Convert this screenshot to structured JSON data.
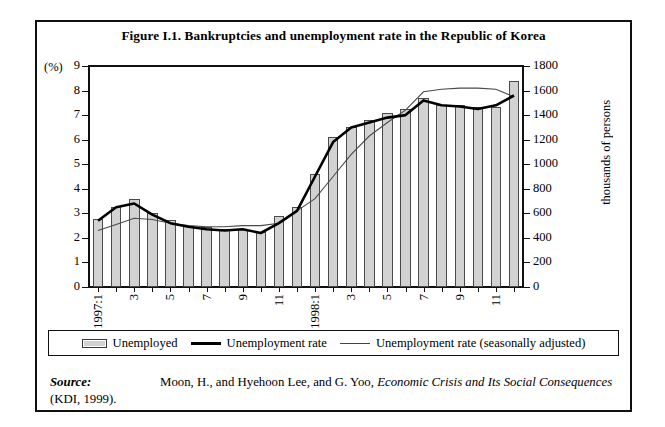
{
  "figure": {
    "title": "Figure I.1.  Bankruptcies and unemployment rate in the Republic of Korea",
    "left_axis_unit": "(%)",
    "right_axis_title": "thousands of persons"
  },
  "legend": {
    "items": [
      {
        "label": "Unemployed",
        "marker": "bar-swatch",
        "color": "#d2d2d2"
      },
      {
        "label": "Unemployment rate",
        "marker": "thick-line",
        "color": "#000000"
      },
      {
        "label": "Unemployment rate (seasonally adjusted)",
        "marker": "thin-line",
        "color": "#444444"
      }
    ]
  },
  "source": {
    "label": "Source:",
    "text_1": "Moon, H., and Hyehoon Lee, and G. Yoo, ",
    "text_italic": "Economic Crisis and Its Social Consequences",
    "text_2": " (KDI, 1999)."
  },
  "chart_data": {
    "type": "bar",
    "title": "Figure I.1.  Bankruptcies and unemployment rate in the Republic of Korea",
    "xlabel": "",
    "ylabel": "(%)",
    "y2label": "thousands of persons",
    "ylim": [
      0,
      9
    ],
    "y2lim": [
      0,
      1800
    ],
    "yticks": [
      0,
      1,
      2,
      3,
      4,
      5,
      6,
      7,
      8,
      9
    ],
    "y2ticks": [
      0,
      200,
      400,
      600,
      800,
      1000,
      1200,
      1400,
      1600,
      1800
    ],
    "grid": false,
    "legend_position": "below-plot",
    "x": [
      "1997:1",
      "1997:2",
      "1997:3",
      "1997:4",
      "1997:5",
      "1997:6",
      "1997:7",
      "1997:8",
      "1997:9",
      "1997:10",
      "1997:11",
      "1997:12",
      "1998:1",
      "1998:2",
      "1998:3",
      "1998:4",
      "1998:5",
      "1998:6",
      "1998:7",
      "1998:8",
      "1998:9",
      "1998:10",
      "1998:11",
      "1998:12"
    ],
    "xtick_labels": [
      "1997:1",
      "3",
      "5",
      "7",
      "9",
      "11",
      "1998:1",
      "3",
      "5",
      "7",
      "9",
      "11"
    ],
    "xtick_indices": [
      0,
      2,
      4,
      6,
      8,
      10,
      12,
      14,
      16,
      18,
      20,
      22
    ],
    "series": [
      {
        "name": "Unemployed",
        "type": "bar",
        "axis": "right",
        "unit": "thousands of persons",
        "values": [
          556,
          654,
          714,
          606,
          544,
          500,
          486,
          470,
          470,
          450,
          576,
          654,
          920,
          1220,
          1300,
          1360,
          1420,
          1450,
          1540,
          1480,
          1480,
          1470,
          1470,
          1680
        ],
        "values_percent_scale": [
          2.78,
          3.27,
          3.57,
          3.03,
          2.72,
          2.5,
          2.43,
          2.35,
          2.35,
          2.25,
          2.88,
          3.27,
          4.6,
          6.1,
          6.5,
          6.8,
          7.1,
          7.25,
          7.7,
          7.4,
          7.4,
          7.35,
          7.35,
          8.4
        ]
      },
      {
        "name": "Unemployment rate",
        "type": "line",
        "axis": "left",
        "unit": "%",
        "values": [
          2.7,
          3.25,
          3.4,
          2.95,
          2.6,
          2.45,
          2.35,
          2.3,
          2.35,
          2.2,
          2.6,
          3.1,
          4.5,
          5.9,
          6.5,
          6.7,
          6.9,
          7.0,
          7.6,
          7.4,
          7.35,
          7.25,
          7.4,
          7.8
        ]
      },
      {
        "name": "Unemployment rate (seasonally adjusted)",
        "type": "line",
        "axis": "left",
        "unit": "%",
        "values": [
          2.3,
          2.55,
          2.8,
          2.75,
          2.6,
          2.5,
          2.45,
          2.45,
          2.5,
          2.5,
          2.6,
          3.1,
          3.6,
          4.5,
          5.4,
          6.15,
          6.7,
          7.2,
          7.95,
          8.05,
          8.1,
          8.1,
          8.05,
          7.75
        ]
      }
    ]
  }
}
